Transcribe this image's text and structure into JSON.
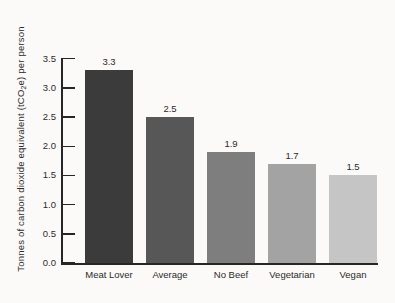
{
  "chart_data": {
    "type": "bar",
    "title": "",
    "categories": [
      "Meat Lover",
      "Average",
      "No Beef",
      "Vegetarian",
      "Vegan"
    ],
    "values": [
      3.3,
      2.5,
      1.9,
      1.7,
      1.5
    ],
    "value_labels": [
      "3.3",
      "2.5",
      "1.9",
      "1.7",
      "1.5"
    ],
    "bar_colors": [
      "#3b3b3b",
      "#575757",
      "#7e7e7e",
      "#a3a3a3",
      "#c5c5c5"
    ],
    "xlabel": "",
    "ylabel": "Tonnes of carbon dioxide equivalent (tCO2e) per person",
    "ylabel_parts": {
      "pre": "Tonnes of carbon dioxide equivalent (tCO",
      "sub": "2",
      "post": "e) per person"
    },
    "ylim": [
      0,
      3.5
    ],
    "yticks": [
      0.0,
      0.5,
      1.0,
      1.5,
      2.0,
      2.5,
      3.0,
      3.5
    ],
    "ytick_labels": [
      "0.0",
      "0.5",
      "1.0",
      "1.5",
      "2.0",
      "2.5",
      "3.0",
      "3.5"
    ],
    "grid": false,
    "legend": "none",
    "colors": {
      "axis": "#262626",
      "text": "#2b2b2b",
      "background": "#fbfaf8"
    }
  }
}
